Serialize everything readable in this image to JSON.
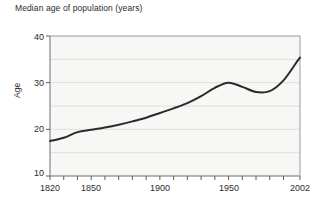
{
  "chart_data": {
    "type": "line",
    "title": "Median age of population (years)",
    "xlabel": "",
    "ylabel": "Age",
    "xlim": [
      1820,
      2002
    ],
    "ylim": [
      10,
      40
    ],
    "grid": true,
    "legend": "none",
    "y_ticks": [
      10,
      20,
      30,
      40
    ],
    "y_gridlines": [
      15,
      20,
      25,
      30,
      35
    ],
    "x_ticks": [
      1820,
      1830,
      1840,
      1850,
      1860,
      1870,
      1880,
      1890,
      1900,
      1910,
      1920,
      1930,
      1940,
      1950,
      1960,
      1970,
      1980,
      1990,
      2002
    ],
    "x_tick_labels": [
      "1820",
      "1850",
      "1900",
      "1950",
      "2002"
    ],
    "x_tick_label_values": [
      1820,
      1850,
      1900,
      1950,
      2002
    ],
    "series": [
      {
        "name": "Median age",
        "color": "#2b2b2b",
        "x": [
          1820,
          1830,
          1840,
          1850,
          1860,
          1870,
          1880,
          1890,
          1900,
          1910,
          1920,
          1930,
          1940,
          1950,
          1960,
          1970,
          1980,
          1990,
          2000,
          2002
        ],
        "values": [
          17.5,
          18.2,
          19.4,
          19.9,
          20.4,
          21.0,
          21.7,
          22.5,
          23.5,
          24.5,
          25.6,
          27.1,
          28.9,
          30.0,
          29.1,
          28.0,
          28.2,
          30.5,
          34.6,
          35.4
        ]
      }
    ]
  },
  "axis_labels": {
    "y": [
      "40",
      "30",
      "20",
      "10"
    ],
    "x": [
      "1820",
      "1850",
      "1900",
      "1950",
      "2002"
    ]
  }
}
